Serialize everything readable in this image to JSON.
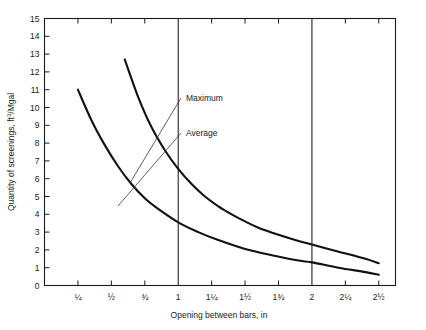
{
  "chart_data": {
    "type": "line",
    "title": "",
    "xlabel": "Opening between bars, in",
    "ylabel": "Quantity of screenings, ft3/Mgal",
    "ylabel_parts": {
      "pre": "Quantity of screenings, ft",
      "sup": "3",
      "post": "/Mgal"
    },
    "xlim": [
      0,
      2.625
    ],
    "ylim": [
      0,
      15
    ],
    "grid": false,
    "vertical_reference_lines": [
      1,
      2
    ],
    "xticks": [
      0.25,
      0.5,
      0.75,
      1,
      1.25,
      1.5,
      1.75,
      2,
      2.25,
      2.5
    ],
    "xtick_labels": [
      "¼",
      "½",
      "¾",
      "1",
      "1¼",
      "1½",
      "1¾",
      "2",
      "2¼",
      "2½"
    ],
    "yticks": [
      0,
      1,
      2,
      3,
      4,
      5,
      6,
      7,
      8,
      9,
      10,
      11,
      12,
      13,
      14,
      15
    ],
    "ytick_labels": [
      "0",
      "1",
      "2",
      "3",
      "4",
      "5",
      "6",
      "7",
      "8",
      "9",
      "10",
      "11",
      "12",
      "13",
      "14",
      "15"
    ],
    "legend_position": "inline-annotations",
    "series": [
      {
        "name": "Maximum",
        "x": [
          0.6,
          0.7,
          0.8,
          0.9,
          1.0,
          1.1,
          1.2,
          1.3,
          1.4,
          1.5,
          1.6,
          1.75,
          1.9,
          2.0,
          2.2,
          2.4,
          2.5
        ],
        "values": [
          12.7,
          10.6,
          8.9,
          7.6,
          6.55,
          5.7,
          5.0,
          4.45,
          4.0,
          3.6,
          3.25,
          2.85,
          2.5,
          2.3,
          1.9,
          1.5,
          1.25
        ]
      },
      {
        "name": "Average",
        "x": [
          0.25,
          0.35,
          0.45,
          0.55,
          0.65,
          0.75,
          0.85,
          1.0,
          1.15,
          1.3,
          1.5,
          1.7,
          1.9,
          2.0,
          2.2,
          2.4,
          2.5
        ],
        "values": [
          11.0,
          9.3,
          7.9,
          6.7,
          5.7,
          4.9,
          4.3,
          3.55,
          3.0,
          2.55,
          2.05,
          1.7,
          1.4,
          1.3,
          1.0,
          0.75,
          0.6
        ]
      }
    ],
    "annotations": [
      {
        "label": "Maximum",
        "text_x": 186,
        "text_y": 101,
        "leader_from_x": 181,
        "leader_from_y": 98,
        "leader_to_x": 130,
        "leader_to_y": 183
      },
      {
        "label": "Average",
        "text_x": 186,
        "text_y": 136,
        "leader_from_x": 181,
        "leader_from_y": 133,
        "leader_to_x": 118,
        "leader_to_y": 206
      }
    ]
  },
  "colors": {
    "axis": "#1a1a1a",
    "curve": "#111111",
    "leader": "#3a3a3a",
    "background": "#ffffff"
  }
}
